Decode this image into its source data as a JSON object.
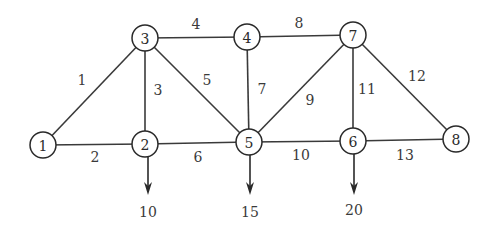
{
  "diagram": {
    "type": "truss",
    "nodes": [
      {
        "id": "1",
        "x": 43,
        "y": 145
      },
      {
        "id": "2",
        "x": 145,
        "y": 144
      },
      {
        "id": "3",
        "x": 145,
        "y": 38
      },
      {
        "id": "4",
        "x": 247,
        "y": 37
      },
      {
        "id": "5",
        "x": 249,
        "y": 142
      },
      {
        "id": "6",
        "x": 353,
        "y": 141
      },
      {
        "id": "7",
        "x": 353,
        "y": 35
      },
      {
        "id": "8",
        "x": 456,
        "y": 139
      }
    ],
    "members": [
      {
        "id": "1",
        "from": "1",
        "to": "3",
        "lx": 82,
        "ly": 80
      },
      {
        "id": "2",
        "from": "1",
        "to": "2",
        "lx": 95,
        "ly": 157
      },
      {
        "id": "3",
        "from": "2",
        "to": "3",
        "lx": 158,
        "ly": 90
      },
      {
        "id": "4",
        "from": "3",
        "to": "4",
        "lx": 196,
        "ly": 24
      },
      {
        "id": "5",
        "from": "3",
        "to": "5",
        "lx": 207,
        "ly": 80
      },
      {
        "id": "6",
        "from": "2",
        "to": "5",
        "lx": 198,
        "ly": 157
      },
      {
        "id": "7",
        "from": "4",
        "to": "5",
        "lx": 262,
        "ly": 89
      },
      {
        "id": "8",
        "from": "4",
        "to": "7",
        "lx": 299,
        "ly": 23
      },
      {
        "id": "9",
        "from": "5",
        "to": "7",
        "lx": 310,
        "ly": 100
      },
      {
        "id": "10",
        "from": "5",
        "to": "6",
        "lx": 301,
        "ly": 155
      },
      {
        "id": "11",
        "from": "6",
        "to": "7",
        "lx": 367,
        "ly": 89
      },
      {
        "id": "12",
        "from": "7",
        "to": "8",
        "lx": 417,
        "ly": 76
      },
      {
        "id": "13",
        "from": "6",
        "to": "8",
        "lx": 405,
        "ly": 155
      }
    ],
    "loads": [
      {
        "node": "2",
        "value": "10",
        "x": 148,
        "y_top": 157,
        "y_tip": 195,
        "lx": 148,
        "ly": 212
      },
      {
        "node": "5",
        "value": "15",
        "x": 250,
        "y_top": 155,
        "y_tip": 195,
        "lx": 250,
        "ly": 212
      },
      {
        "node": "6",
        "value": "20",
        "x": 354,
        "y_top": 154,
        "y_tip": 195,
        "lx": 354,
        "ly": 210
      }
    ]
  }
}
